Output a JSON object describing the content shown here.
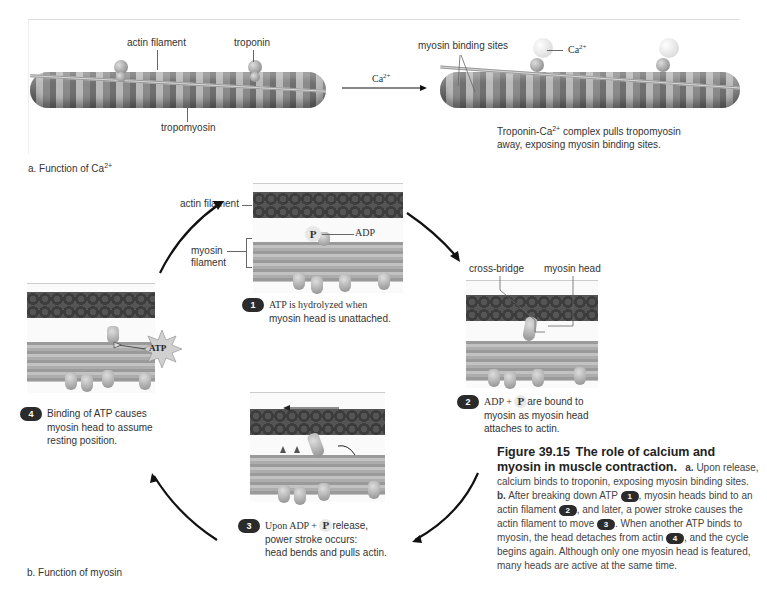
{
  "panel_a": {
    "labels": {
      "actin_filament": "actin filament",
      "troponin": "troponin",
      "tropomyosin": "tropomyosin",
      "myosin_binding_sites": "myosin binding sites",
      "ca_ion": "Ca",
      "ca_sup": "2+",
      "arrow_ca": "Ca",
      "arrow_ca_sup": "2+"
    },
    "description_pre": "Troponin-Ca",
    "description_sup": "2+",
    "description_post": " complex pulls tropomyosin",
    "description_line2": "away, exposing myosin binding sites.",
    "title_pre": "a. Function of Ca",
    "title_sup": "2+"
  },
  "panel_b": {
    "title": "b. Function of myosin",
    "step1": {
      "number": "1",
      "line1": "ATP is hydrolyzed when",
      "line2": "myosin head is unattached.",
      "labels": {
        "actin_filament": "actin filament",
        "myosin_filament_1": "myosin",
        "myosin_filament_2": "filament",
        "p": "P",
        "adp": "ADP"
      }
    },
    "step2": {
      "number": "2",
      "pre": "ADP + ",
      "p": "P",
      "post": "are bound to",
      "line2": "myosin as myosin head",
      "line3": "attaches to actin.",
      "labels": {
        "cross_bridge": "cross-bridge",
        "myosin_head": "myosin head"
      }
    },
    "step3": {
      "number": "3",
      "pre": "Upon ADP + ",
      "p": "P",
      "post": "release,",
      "line2": "power stroke occurs:",
      "line3": "head bends and pulls actin."
    },
    "step4": {
      "number": "4",
      "line1": "Binding of ATP causes",
      "line2": "myosin head to assume",
      "line3": "resting position.",
      "labels": {
        "atp": "ATP"
      }
    }
  },
  "caption": {
    "figure_number": "Figure 39.15",
    "title": "The role of calcium and myosin in muscle contraction.",
    "a_label": "a.",
    "a_text": "Upon release, calcium binds to troponin, exposing myosin binding sites.",
    "b_label": "b.",
    "b_text_1": "After breaking down ATP",
    "b_num_1": "1",
    "b_text_2": ", myosin heads bind to an actin filament",
    "b_num_2": "2",
    "b_text_3": ", and later, a power stroke causes the actin filament to move",
    "b_num_3": "3",
    "b_text_4": ". When another ATP binds to myosin, the head detaches from actin",
    "b_num_4": "4",
    "b_text_5": ", and the cycle begins again. Although only one myosin head is featured, many heads are active at the same time."
  },
  "colors": {
    "text": "#333333",
    "badge": "#2b2b2b",
    "arrow": "#111111",
    "actin": "#444444",
    "myosin": "#adadad"
  }
}
